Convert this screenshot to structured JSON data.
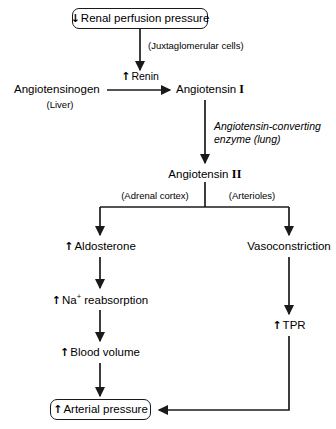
{
  "diagram": {
    "stroke_color": "#1a1a1a",
    "background": "#ffffff",
    "nodes": {
      "renal_perfusion": {
        "arrow": "↓",
        "label": "Renal perfusion pressure",
        "boxed": true
      },
      "angiotensinogen": {
        "label": "Angiotensinogen",
        "sublabel": "(Liver)"
      },
      "renin": {
        "arrow": "↑",
        "label": "Renin"
      },
      "angiotensin_1": {
        "label": "Angiotensin",
        "numeral": "I"
      },
      "angiotensin_2": {
        "label": "Angiotensin",
        "numeral": "II"
      },
      "aldosterone": {
        "arrow": "↑",
        "label": "Aldosterone"
      },
      "na_reabsorption": {
        "arrow": "↑",
        "label_pre": "Na",
        "label_sup": "+",
        "label_post": " reabsorption"
      },
      "blood_volume": {
        "arrow": "↑",
        "label": "Blood volume"
      },
      "vasoconstriction": {
        "label": "Vasoconstriction"
      },
      "tpr": {
        "arrow": "↑",
        "label": "TPR"
      },
      "arterial_pressure": {
        "arrow": "↑",
        "label": "Arterial pressure",
        "boxed": true
      }
    },
    "edge_labels": {
      "juxtaglomerular": "(Juxtaglomerular cells)",
      "ace": "Angiotensin-converting enzyme (lung)",
      "adrenal_cortex": "(Adrenal cortex)",
      "arterioles": "(Arterioles)"
    }
  }
}
